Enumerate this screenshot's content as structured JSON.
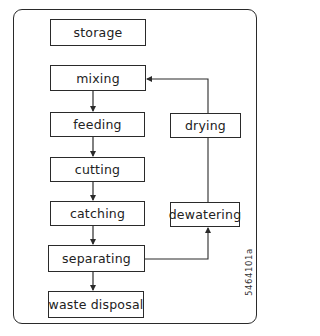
{
  "diagram": {
    "type": "flowchart",
    "main_chain": [
      {
        "id": "storage",
        "label": "storage"
      },
      {
        "id": "mixing",
        "label": "mixing"
      },
      {
        "id": "feeding",
        "label": "feeding"
      },
      {
        "id": "cutting",
        "label": "cutting"
      },
      {
        "id": "catching",
        "label": "catching"
      },
      {
        "id": "separating",
        "label": "separating"
      },
      {
        "id": "waste_disposal",
        "label": "waste disposal"
      }
    ],
    "side_chain": [
      {
        "id": "drying",
        "label": "drying"
      },
      {
        "id": "dewatering",
        "label": "dewatering"
      }
    ],
    "edges": [
      {
        "from": "mixing",
        "to": "feeding"
      },
      {
        "from": "feeding",
        "to": "cutting"
      },
      {
        "from": "cutting",
        "to": "catching"
      },
      {
        "from": "catching",
        "to": "separating"
      },
      {
        "from": "separating",
        "to": "waste_disposal"
      },
      {
        "from": "separating",
        "to": "dewatering"
      },
      {
        "from": "dewatering",
        "to": "drying"
      },
      {
        "from": "drying",
        "to": "mixing"
      }
    ],
    "figure_code": "5464101a",
    "colors": {
      "line": "#2a2a2a",
      "background": "#ffffff",
      "text": "#222222"
    }
  }
}
